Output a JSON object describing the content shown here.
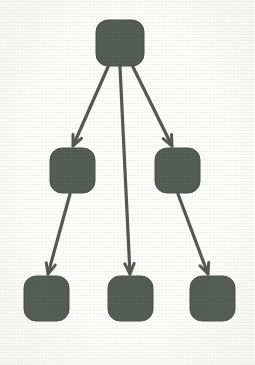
{
  "diagram": {
    "type": "tree",
    "canvas": {
      "width": 255,
      "height": 365,
      "background": "#fdfdfc"
    },
    "style": {
      "node_fill": "#565b56",
      "node_stroke": "#4a4f4a",
      "edge_color": "#545954",
      "edge_width": 3.2,
      "node_corner_radius": 12,
      "arrowhead_shape": "open-v"
    },
    "levels": [
      {
        "index": 0,
        "label": "root",
        "node_count": 1
      },
      {
        "index": 1,
        "label": "intermediate",
        "node_count": 2
      },
      {
        "index": 2,
        "label": "leaf",
        "node_count": 3
      }
    ],
    "nodes": [
      {
        "id": "n0",
        "label": "",
        "level": 0,
        "x": 96,
        "y": 20,
        "w": 48,
        "h": 46
      },
      {
        "id": "n1",
        "label": "",
        "level": 1,
        "x": 50,
        "y": 148,
        "w": 45,
        "h": 45
      },
      {
        "id": "n2",
        "label": "",
        "level": 1,
        "x": 155,
        "y": 148,
        "w": 45,
        "h": 45
      },
      {
        "id": "n3",
        "label": "",
        "level": 2,
        "x": 24,
        "y": 276,
        "w": 45,
        "h": 45
      },
      {
        "id": "n4",
        "label": "",
        "level": 2,
        "x": 108,
        "y": 276,
        "w": 45,
        "h": 45
      },
      {
        "id": "n5",
        "label": "",
        "level": 2,
        "x": 190,
        "y": 276,
        "w": 45,
        "h": 45
      }
    ],
    "edges": [
      {
        "id": "e0",
        "from": "n0",
        "to": "n1",
        "x1": 108,
        "y1": 67,
        "x2": 73,
        "y2": 146,
        "directed": true
      },
      {
        "id": "e1",
        "from": "n0",
        "to": "n4",
        "x1": 120,
        "y1": 67,
        "x2": 130,
        "y2": 274,
        "directed": true
      },
      {
        "id": "e2",
        "from": "n0",
        "to": "n2",
        "x1": 133,
        "y1": 67,
        "x2": 172,
        "y2": 146,
        "directed": true
      },
      {
        "id": "e3",
        "from": "n1",
        "to": "n3",
        "x1": 70,
        "y1": 194,
        "x2": 48,
        "y2": 274,
        "directed": true
      },
      {
        "id": "e4",
        "from": "n2",
        "to": "n5",
        "x1": 178,
        "y1": 194,
        "x2": 208,
        "y2": 274,
        "directed": true
      }
    ]
  }
}
